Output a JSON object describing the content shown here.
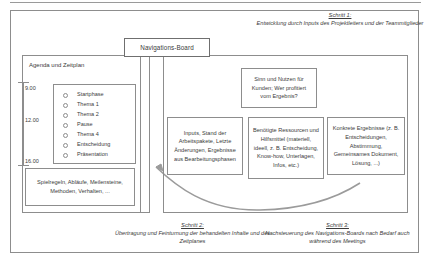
{
  "diagram": {
    "nav_board_label": "Navigations-Board",
    "left_panel": {
      "title": "Agenda und Zeitplan",
      "times": [
        "9.00",
        "12.00",
        "16.00"
      ],
      "agenda_items": [
        "Startphase",
        "Thema 1",
        "Thema 2",
        "Pause",
        "Thema 4",
        "Entscheidung",
        "Präsentation"
      ],
      "rules_card": "Spielregeln, Abläufe, Meilensteine, Methoden, Verhalten, ..."
    },
    "right_panel": {
      "box_kunden": "Sinn und Nutzen für Kunden; Wer profitiert vom Ergebnis?",
      "box_inputs": "Inputs, Stand der Arbeitspakete, Letzte Änderungen, Ergebnisse aus Bearbeitungsphasen",
      "box_ressourcen": "Benötigte Ressourcen und Hilfsmittel (materiell, ideell, z. B. Entscheidung, Know-how, Unterlagen, Infos, etc.)",
      "box_ergebnisse": "Konkrete Ergebnisse (z. B. Entscheidungen, Abstimmung, Gemeinsames Dokument, Lösung, ...)"
    },
    "captions": {
      "step1_heading": "Schritt 1:",
      "step1_body": "Entwicklung durch Inputs des Projektleiters und der Teammitglieder",
      "step2_heading": "Schritt 2:",
      "step2_body": "Übertragung und Feinturnung der behandelten Inhalte und des Zeitplanes",
      "step3_heading": "Schritt 3:",
      "step3_body": "Nachsteuerung des Navigations-Boards nach Bedarf auch während des Meetings"
    },
    "colors": {
      "line": "#8d8d8d",
      "text": "#3b3b3b",
      "background": "#ffffff"
    }
  }
}
